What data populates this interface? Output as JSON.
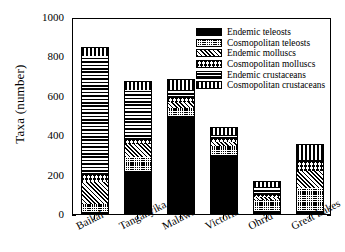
{
  "chart_data": {
    "type": "bar",
    "subtype": "stacked-bar",
    "title": "",
    "xlabel": "",
    "ylabel": "Taxa (number)",
    "ylim": [
      0,
      1000
    ],
    "yticks": [
      0,
      200,
      400,
      600,
      800,
      1000
    ],
    "grid": false,
    "legend_position": "upper right",
    "categories": [
      "Baikal",
      "Tanganyika",
      "Malawi",
      "Victoria",
      "Ohrid",
      "Great Lakes"
    ],
    "series": [
      {
        "name": "Endemic teleosts",
        "pattern": "solid-black",
        "values": [
          10,
          220,
          500,
          300,
          15,
          15
        ]
      },
      {
        "name": "Cosmopolitan teleosts",
        "pattern": "fine-dotted",
        "values": [
          40,
          70,
          40,
          45,
          55,
          115
        ]
      },
      {
        "name": "Endemic molluscs",
        "pattern": "diagonal-hatch",
        "values": [
          115,
          65,
          30,
          20,
          15,
          90
        ]
      },
      {
        "name": "Cosmopolitan molluscs",
        "pattern": "cross-hatch",
        "values": [
          35,
          20,
          20,
          15,
          10,
          45
        ]
      },
      {
        "name": "Endemic crustaceans",
        "pattern": "horizontal-lines",
        "values": [
          600,
          255,
          40,
          20,
          40,
          10
        ]
      },
      {
        "name": "Cosmopolitan crustaceans",
        "pattern": "vertical-lines",
        "values": [
          50,
          45,
          55,
          40,
          35,
          80
        ]
      }
    ],
    "totals": [
      850,
      675,
      685,
      440,
      170,
      355
    ]
  },
  "axes": {
    "y_label": "Taxa (number)",
    "y_ticks": [
      "0",
      "200",
      "400",
      "600",
      "800",
      "1000"
    ],
    "x_ticks": [
      "Baikal",
      "Tanganyika",
      "Malawi",
      "Victoria",
      "Ohrid",
      "Great Lakes"
    ]
  },
  "legend": {
    "entries": [
      {
        "label": "Endemic teleosts"
      },
      {
        "label": "Cosmopolitan teleosts"
      },
      {
        "label": "Endemic molluscs"
      },
      {
        "label": "Cosmopolitan molluscs"
      },
      {
        "label": "Endemic crustaceans"
      },
      {
        "label": "Cosmopolitan crustaceans"
      }
    ]
  },
  "colors": {
    "ink": "#000000",
    "paper": "#ffffff"
  }
}
